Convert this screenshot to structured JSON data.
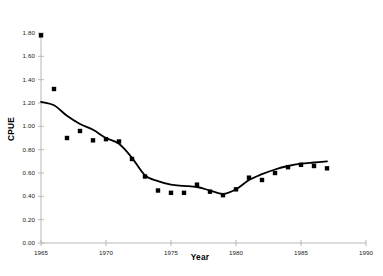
{
  "chart_data": {
    "type": "scatter",
    "title": "",
    "xlabel": "Year",
    "ylabel": "CPUE",
    "xlim": [
      1965,
      1990
    ],
    "ylim": [
      0.0,
      1.8
    ],
    "grid": false,
    "legend": "none",
    "xticks": [
      "1965",
      "1970",
      "1975",
      "1980",
      "1985",
      "1990"
    ],
    "xtick_values": [
      1965,
      1970,
      1975,
      1980,
      1985,
      1990
    ],
    "yticks": [
      "0.00",
      "0.20",
      "0.40",
      "0.60",
      "0.80",
      "1.00",
      "1.20",
      "1.40",
      "1.60",
      "1.80"
    ],
    "ytick_values": [
      0.0,
      0.2,
      0.4,
      0.6,
      0.8,
      1.0,
      1.2,
      1.4,
      1.6,
      1.8
    ],
    "series": [
      {
        "name": "CPUE observations",
        "type": "scatter",
        "marker": "square",
        "color": "#000000",
        "x": [
          1965,
          1966,
          1967,
          1968,
          1969,
          1970,
          1971,
          1972,
          1973,
          1974,
          1975,
          1976,
          1977,
          1978,
          1979,
          1980,
          1981,
          1982,
          1983,
          1984,
          1985,
          1986,
          1987
        ],
        "values": [
          1.78,
          1.32,
          0.9,
          0.96,
          0.88,
          0.89,
          0.87,
          0.72,
          0.57,
          0.45,
          0.43,
          0.43,
          0.5,
          0.44,
          0.41,
          0.46,
          0.56,
          0.54,
          0.6,
          0.65,
          0.67,
          0.66,
          0.64
        ]
      },
      {
        "name": "Smoothed trend",
        "type": "line",
        "color": "#000000",
        "x": [
          1965,
          1966,
          1967,
          1968,
          1969,
          1970,
          1971,
          1972,
          1973,
          1974,
          1975,
          1976,
          1977,
          1978,
          1979,
          1980,
          1981,
          1982,
          1983,
          1984,
          1985,
          1986,
          1987
        ],
        "values": [
          1.21,
          1.18,
          1.09,
          1.02,
          0.97,
          0.9,
          0.85,
          0.73,
          0.58,
          0.53,
          0.5,
          0.49,
          0.48,
          0.45,
          0.42,
          0.46,
          0.54,
          0.59,
          0.63,
          0.66,
          0.68,
          0.69,
          0.7
        ]
      }
    ]
  }
}
